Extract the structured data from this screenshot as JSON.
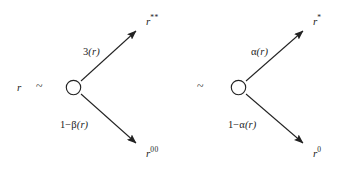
{
  "diagram": {
    "type": "branching-transition-diagram",
    "source": {
      "variable": "r",
      "relation_symbol": "~"
    },
    "separator": {
      "relation_symbol": "~"
    },
    "branches": [
      {
        "id": "left",
        "node_shape": "circle",
        "up": {
          "edge_label": "3(r)",
          "edge_label_parts": {
            "coefficient": "3",
            "argument": "(r)"
          },
          "target": "r",
          "target_superscript": "**"
        },
        "down": {
          "edge_label": "1−β(r)",
          "edge_label_parts": {
            "coefficient": "1−β",
            "argument": "(r)"
          },
          "target": "r",
          "target_superscript": "00"
        }
      },
      {
        "id": "right",
        "node_shape": "circle",
        "up": {
          "edge_label": "α(r)",
          "edge_label_parts": {
            "coefficient": "α",
            "argument": "(r)"
          },
          "target": "r",
          "target_superscript": "*"
        },
        "down": {
          "edge_label": "1−α(r)",
          "edge_label_parts": {
            "coefficient": "1−α",
            "argument": "(r)"
          },
          "target": "r",
          "target_superscript": "0"
        }
      }
    ],
    "style": {
      "stroke_color": "#222222",
      "background": "#ffffff",
      "node_fill": "#ffffff"
    }
  }
}
